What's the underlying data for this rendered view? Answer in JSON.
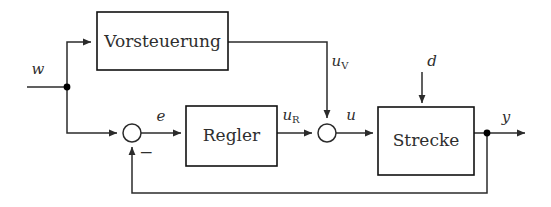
{
  "diagram": {
    "kind": "control-block-diagram",
    "language": "de",
    "background_color": "#ffffff",
    "line_color": "#2b2b2b",
    "box_border_color": "#111111",
    "text_color": "#2e2e2e",
    "blocks": [
      {
        "id": "vorsteuerung",
        "label": "Vorsteuerung",
        "x": 97,
        "y": 12,
        "width": 131,
        "height": 58
      },
      {
        "id": "regler",
        "label": "Regler",
        "x": 186,
        "y": 106,
        "width": 91,
        "height": 60
      },
      {
        "id": "strecke",
        "label": "Strecke",
        "x": 378,
        "y": 107,
        "width": 96,
        "height": 68
      }
    ],
    "junctions": [
      {
        "id": "sum-error",
        "cx": 132,
        "cy": 133,
        "r": 9
      },
      {
        "id": "sum-control",
        "cx": 327,
        "cy": 133,
        "r": 9
      }
    ],
    "nodes": [
      {
        "id": "branch-w",
        "cx": 67,
        "cy": 87,
        "r": 3.2
      },
      {
        "id": "branch-y",
        "cx": 487,
        "cy": 133,
        "r": 3.2
      }
    ],
    "signals": [
      {
        "id": "w",
        "base": "w",
        "sub": "",
        "x": 38,
        "y": 70
      },
      {
        "id": "e",
        "base": "e",
        "sub": "",
        "x": 161,
        "y": 117
      },
      {
        "id": "uR",
        "base": "u",
        "sub": "R",
        "x": 291,
        "y": 116
      },
      {
        "id": "uV",
        "base": "u",
        "sub": "V",
        "x": 340,
        "y": 62
      },
      {
        "id": "u",
        "base": "u",
        "sub": "",
        "x": 351,
        "y": 116
      },
      {
        "id": "d",
        "base": "d",
        "sub": "",
        "x": 432,
        "y": 62
      },
      {
        "id": "y",
        "base": "y",
        "sub": "",
        "x": 506,
        "y": 118
      }
    ],
    "minus_sign": {
      "text": "−",
      "x": 146,
      "y": 153
    }
  }
}
